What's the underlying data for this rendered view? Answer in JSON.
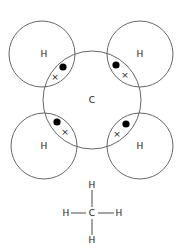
{
  "diagram": {
    "atoms": {
      "center": {
        "label": "C"
      },
      "top_left": {
        "label": "H"
      },
      "top_right": {
        "label": "H"
      },
      "bottom_left": {
        "label": "H"
      },
      "bottom_right": {
        "label": "H"
      }
    },
    "electron_symbols": {
      "dot": "●",
      "cross": "×"
    },
    "structural_formula": {
      "center": "C",
      "top": "H",
      "bottom": "H",
      "left": "H",
      "right": "H"
    },
    "colors": {
      "line": "#555555",
      "text": "#222222",
      "dot": "#000000"
    }
  }
}
